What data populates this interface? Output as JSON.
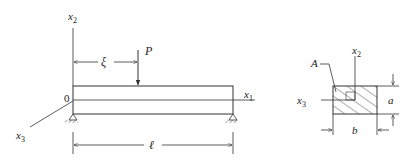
{
  "beam_figure": {
    "axis_x1": "x",
    "axis_x1_sub": "1",
    "axis_x2": "x",
    "axis_x2_sub": "2",
    "axis_x3": "x",
    "axis_x3_sub": "3",
    "origin_label": "0",
    "load_label": "P",
    "load_position_label": "ξ",
    "length_label": "ℓ"
  },
  "cross_section": {
    "area_label": "A",
    "axis_x2": "x",
    "axis_x2_sub": "2",
    "axis_x3": "x",
    "axis_x3_sub": "3",
    "height_label": "a",
    "width_label": "b"
  },
  "colors": {
    "line": "#333333",
    "text": "#222222"
  }
}
